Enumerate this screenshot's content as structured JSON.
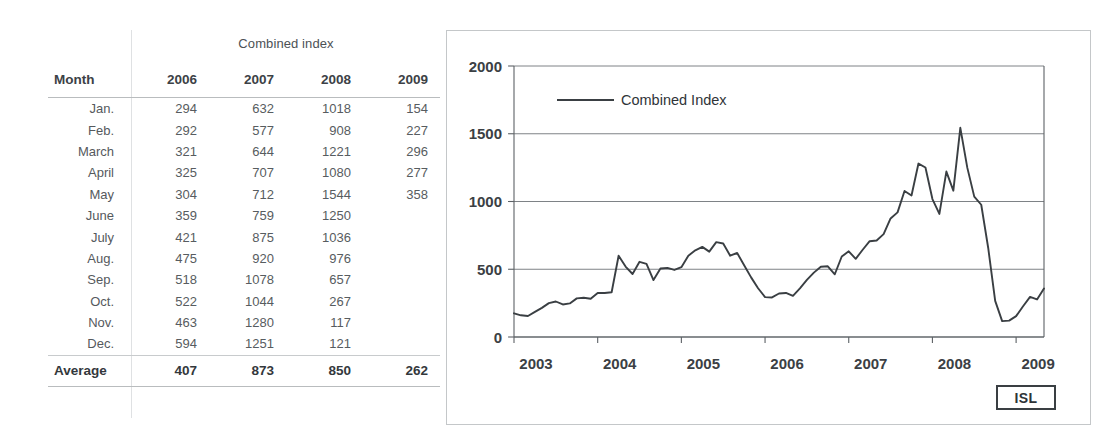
{
  "table": {
    "caption": "Combined index",
    "columns": [
      "Month",
      "2006",
      "2007",
      "2008",
      "2009"
    ],
    "rows": [
      {
        "month": "Jan.",
        "v2006": "294",
        "v2007": "632",
        "v2008": "1018",
        "v2009": "154"
      },
      {
        "month": "Feb.",
        "v2006": "292",
        "v2007": "577",
        "v2008": "908",
        "v2009": "227"
      },
      {
        "month": "March",
        "v2006": "321",
        "v2007": "644",
        "v2008": "1221",
        "v2009": "296"
      },
      {
        "month": "April",
        "v2006": "325",
        "v2007": "707",
        "v2008": "1080",
        "v2009": "277"
      },
      {
        "month": "May",
        "v2006": "304",
        "v2007": "712",
        "v2008": "1544",
        "v2009": "358"
      },
      {
        "month": "June",
        "v2006": "359",
        "v2007": "759",
        "v2008": "1250",
        "v2009": ""
      },
      {
        "month": "July",
        "v2006": "421",
        "v2007": "875",
        "v2008": "1036",
        "v2009": ""
      },
      {
        "month": "Aug.",
        "v2006": "475",
        "v2007": "920",
        "v2008": "976",
        "v2009": ""
      },
      {
        "month": "Sep.",
        "v2006": "518",
        "v2007": "1078",
        "v2008": "657",
        "v2009": ""
      },
      {
        "month": "Oct.",
        "v2006": "522",
        "v2007": "1044",
        "v2008": "267",
        "v2009": ""
      },
      {
        "month": "Nov.",
        "v2006": "463",
        "v2007": "1280",
        "v2008": "117",
        "v2009": ""
      },
      {
        "month": "Dec.",
        "v2006": "594",
        "v2007": "1251",
        "v2008": "121",
        "v2009": ""
      }
    ],
    "average": {
      "label": "Average",
      "v2006": "407",
      "v2007": "873",
      "v2008": "850",
      "v2009": "262"
    }
  },
  "chart_panel": {
    "source_badge": "ISL"
  },
  "chart_data": {
    "type": "line",
    "title": "",
    "xlabel": "",
    "ylabel": "",
    "legend": [
      "Combined Index"
    ],
    "legend_position": "top-left-inside",
    "grid": true,
    "ylim": [
      0,
      2000
    ],
    "yticks": [
      0,
      500,
      1000,
      1500,
      2000
    ],
    "ytick_labels": [
      "0",
      "500",
      "1000",
      "1500",
      "2000"
    ],
    "xlim": [
      "2003-01",
      "2009-05"
    ],
    "xticks": [
      "2003",
      "2004",
      "2005",
      "2006",
      "2007",
      "2008",
      "2009"
    ],
    "xtick_labels": [
      "2003",
      "2004",
      "2005",
      "2006",
      "2007",
      "2008",
      "2009"
    ],
    "series": [
      {
        "name": "Combined Index",
        "color": "#3a3f43",
        "x": [
          "2003-01",
          "2003-02",
          "2003-03",
          "2003-04",
          "2003-05",
          "2003-06",
          "2003-07",
          "2003-08",
          "2003-09",
          "2003-10",
          "2003-11",
          "2003-12",
          "2004-01",
          "2004-02",
          "2004-03",
          "2004-04",
          "2004-05",
          "2004-06",
          "2004-07",
          "2004-08",
          "2004-09",
          "2004-10",
          "2004-11",
          "2004-12",
          "2005-01",
          "2005-02",
          "2005-03",
          "2005-04",
          "2005-05",
          "2005-06",
          "2005-07",
          "2005-08",
          "2005-09",
          "2005-10",
          "2005-11",
          "2005-12",
          "2006-01",
          "2006-02",
          "2006-03",
          "2006-04",
          "2006-05",
          "2006-06",
          "2006-07",
          "2006-08",
          "2006-09",
          "2006-10",
          "2006-11",
          "2006-12",
          "2007-01",
          "2007-02",
          "2007-03",
          "2007-04",
          "2007-05",
          "2007-06",
          "2007-07",
          "2007-08",
          "2007-09",
          "2007-10",
          "2007-11",
          "2007-12",
          "2008-01",
          "2008-02",
          "2008-03",
          "2008-04",
          "2008-05",
          "2008-06",
          "2008-07",
          "2008-08",
          "2008-09",
          "2008-10",
          "2008-11",
          "2008-12",
          "2009-01",
          "2009-02",
          "2009-03",
          "2009-04",
          "2009-05"
        ],
        "values": [
          175,
          160,
          155,
          185,
          215,
          250,
          262,
          240,
          248,
          285,
          290,
          282,
          325,
          325,
          330,
          600,
          520,
          465,
          555,
          540,
          420,
          505,
          510,
          495,
          515,
          600,
          640,
          665,
          630,
          700,
          690,
          600,
          620,
          530,
          440,
          360,
          294,
          292,
          321,
          325,
          304,
          359,
          421,
          475,
          518,
          522,
          463,
          594,
          632,
          577,
          644,
          707,
          712,
          759,
          875,
          920,
          1078,
          1044,
          1280,
          1251,
          1018,
          908,
          1221,
          1080,
          1544,
          1250,
          1036,
          976,
          657,
          267,
          117,
          121,
          154,
          227,
          296,
          277,
          358
        ]
      }
    ]
  }
}
